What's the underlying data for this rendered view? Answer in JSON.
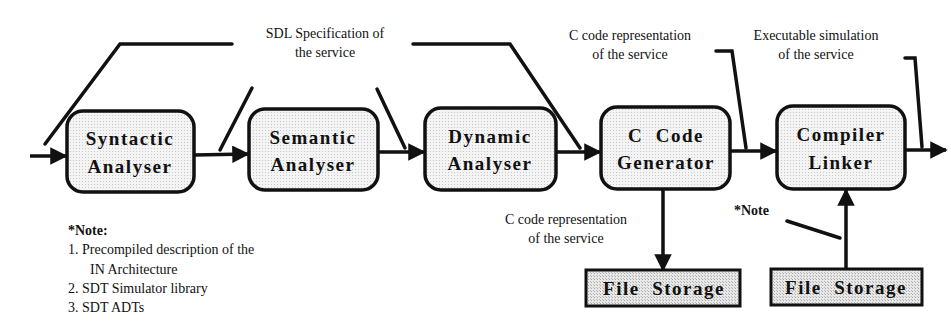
{
  "diagram": {
    "type": "process-flow",
    "annotations": {
      "sdl_spec": [
        "SDL Specification of",
        "the service"
      ],
      "c_code_top": [
        "C code representation",
        "of the service"
      ],
      "executable": [
        "Executable simulation",
        "of the service"
      ],
      "c_code_bottom": [
        "C code representation",
        "of the service"
      ],
      "note_marker": "*Note"
    },
    "stages": [
      {
        "id": "syntactic",
        "lines": [
          "Syntactic",
          "Analyser"
        ]
      },
      {
        "id": "semantic",
        "lines": [
          "Semantic",
          "Analyser"
        ]
      },
      {
        "id": "dynamic",
        "lines": [
          "Dynamic",
          "Analyser"
        ]
      },
      {
        "id": "c-code-generator",
        "lines": [
          "C  Code",
          "Generator"
        ]
      },
      {
        "id": "compiler-linker",
        "lines": [
          "Compiler",
          "Linker"
        ]
      }
    ],
    "storage": [
      {
        "id": "file-storage-output",
        "label": "File  Storage"
      },
      {
        "id": "file-storage-input",
        "label": "File  Storage"
      }
    ],
    "note": {
      "title": "*Note:",
      "items": [
        "1. Precompiled description of the",
        "IN  Architecture",
        "2. SDT Simulator library",
        "3. SDT ADTs"
      ]
    },
    "colors": {
      "stroke": "#111111",
      "box_fill": "#f2f2f2",
      "storage_fill": "#e4e4e4"
    }
  }
}
